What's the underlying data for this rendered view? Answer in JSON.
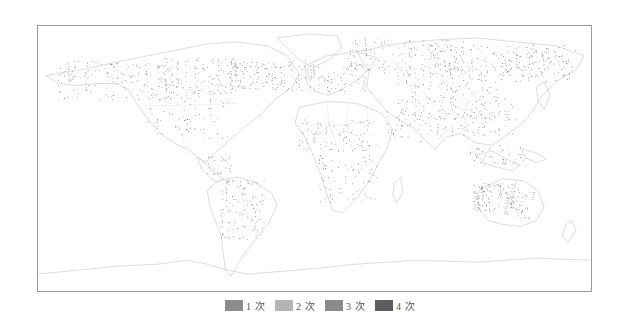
{
  "map": {
    "type": "world-thematic-point-map",
    "frame": {
      "border_color": "#9a9a9a"
    },
    "regions_with_dense_points": [
      "North America (Canada, USA)",
      "Central America",
      "South America (Brazil, Argentina)",
      "Europe",
      "Russia / Siberia",
      "Central Asia",
      "China",
      "South Asia",
      "Southeast Asia",
      "Sub-Saharan Africa",
      "Australia"
    ],
    "land_line_color": "#b8b8b8",
    "point_color": "#7a7a7a"
  },
  "legend": {
    "items": [
      {
        "label": "1 次",
        "color": "#8c8c8c"
      },
      {
        "label": "2 次",
        "color": "#b4b4b4"
      },
      {
        "label": "3 次",
        "color": "#8a8a8a"
      },
      {
        "label": "4 次",
        "color": "#5e5e5e"
      }
    ]
  }
}
